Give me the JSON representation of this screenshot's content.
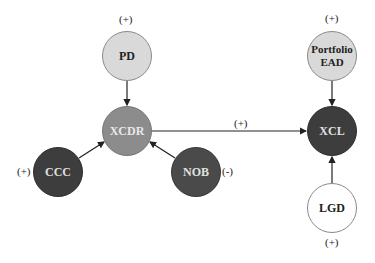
{
  "diagram": {
    "nodes": [
      {
        "id": "PD",
        "label": "PD",
        "cx": 127,
        "cy": 56,
        "r": 25,
        "fill": "#d9d9d9",
        "border": "#8a8a8a",
        "text": "#222222"
      },
      {
        "id": "XCDR",
        "label": "XCDR",
        "cx": 127,
        "cy": 131,
        "r": 25,
        "fill": "#8c8c8c",
        "border": "#777777",
        "text": "#e8e8e8"
      },
      {
        "id": "CCC",
        "label": "CCC",
        "cx": 58,
        "cy": 172,
        "r": 25,
        "fill": "#3d3d3d",
        "border": "#2e2e2e",
        "text": "#e0e0e0"
      },
      {
        "id": "NOB",
        "label": "NOB",
        "cx": 196,
        "cy": 172,
        "r": 25,
        "fill": "#4a4a4a",
        "border": "#383838",
        "text": "#e0e0e0"
      },
      {
        "id": "PortfolioEAD",
        "label": "Portfolio EAD",
        "cx": 332,
        "cy": 56,
        "r": 25,
        "fill": "#d9d9d9",
        "border": "#8a8a8a",
        "text": "#222222"
      },
      {
        "id": "XCL",
        "label": "XCL",
        "cx": 332,
        "cy": 131,
        "r": 25,
        "fill": "#3d3d3d",
        "border": "#2e2e2e",
        "text": "#e0e0e0"
      },
      {
        "id": "LGD",
        "label": "LGD",
        "cx": 332,
        "cy": 208,
        "r": 25,
        "fill": "#ffffff",
        "border": "#8a8a8a",
        "text": "#222222"
      }
    ],
    "edges": [
      {
        "from": "PD",
        "to": "XCDR"
      },
      {
        "from": "CCC",
        "to": "XCDR"
      },
      {
        "from": "NOB",
        "to": "XCDR"
      },
      {
        "from": "XCDR",
        "to": "XCL"
      },
      {
        "from": "PortfolioEAD",
        "to": "XCL"
      },
      {
        "from": "LGD",
        "to": "XCL"
      }
    ],
    "signs": {
      "pd": "(+)",
      "ccc": "(+)",
      "nob": "(-)",
      "xcdr_xcl": "(+)",
      "portfolio_ead": "(+)",
      "lgd": "(+)"
    },
    "labels": {
      "pd": "PD",
      "xcdr": "XCDR",
      "ccc": "CCC",
      "nob": "NOB",
      "portfolio_ead_line1": "Portfolio",
      "portfolio_ead_line2": "EAD",
      "xcl": "XCL",
      "lgd": "LGD"
    }
  }
}
